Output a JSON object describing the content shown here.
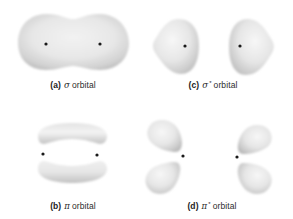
{
  "figure": {
    "panels": [
      {
        "id": "a",
        "tag": "(a)",
        "symbol": "σ",
        "superscript": "",
        "word": "orbital",
        "name": "sigma bonding orbital"
      },
      {
        "id": "b",
        "tag": "(b)",
        "symbol": "π",
        "superscript": "",
        "word": "orbital",
        "name": "pi bonding orbital"
      },
      {
        "id": "c",
        "tag": "(c)",
        "symbol": "σ",
        "superscript": "*",
        "word": "orbital",
        "name": "sigma antibonding orbital"
      },
      {
        "id": "d",
        "tag": "(d)",
        "symbol": "π",
        "superscript": "*",
        "word": "orbital",
        "name": "pi antibonding orbital"
      }
    ],
    "colors": {
      "lobe_light": "#f4f4f4",
      "lobe_mid": "#dcdcdc",
      "lobe_dark": "#b9b9b9",
      "nucleus": "#1a1a1a",
      "text": "#2b2b2b"
    }
  }
}
